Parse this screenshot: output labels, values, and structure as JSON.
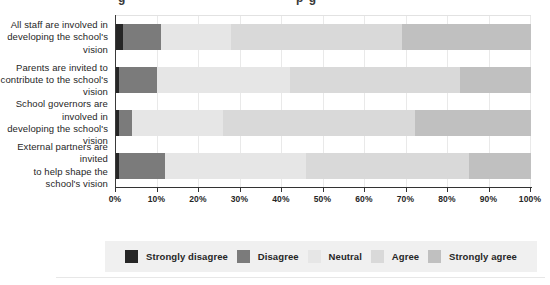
{
  "header": {
    "clipped_fragments": [
      "g",
      "p g"
    ]
  },
  "chart_data": {
    "type": "bar",
    "subtype": "horizontal-stacked-percent",
    "title": "",
    "xlabel": "",
    "ylabel": "",
    "xlim": [
      0,
      100
    ],
    "grid": true,
    "legend_position": "bottom",
    "x_ticks": [
      "0%",
      "10%",
      "20%",
      "30%",
      "40%",
      "50%",
      "60%",
      "70%",
      "80%",
      "90%",
      "100%"
    ],
    "categories": [
      "All staff are involved in\ndeveloping the school's vision",
      "Parents are invited to\ncontribute to the school's vision",
      "School governors are involved in\ndeveloping the school's vision",
      "External partners are invited\nto help shape the school's vision"
    ],
    "series": [
      {
        "name": "Strongly disagree",
        "color": "#262626",
        "values": [
          2,
          1,
          1,
          1
        ]
      },
      {
        "name": "Disagree",
        "color": "#7b7b7b",
        "values": [
          9,
          9,
          3,
          11
        ]
      },
      {
        "name": "Neutral",
        "color": "#e6e6e6",
        "values": [
          17,
          32,
          22,
          34
        ]
      },
      {
        "name": "Agree",
        "color": "#d9d9d9",
        "values": [
          41,
          41,
          46,
          39
        ]
      },
      {
        "name": "Strongly agree",
        "color": "#c0c0c0",
        "values": [
          31,
          17,
          28,
          15
        ]
      }
    ]
  },
  "colors": {
    "legend_background": "#f0f0f0",
    "axis_line": "#333333",
    "gridline": "#e9e9e9",
    "text": "#262626"
  }
}
